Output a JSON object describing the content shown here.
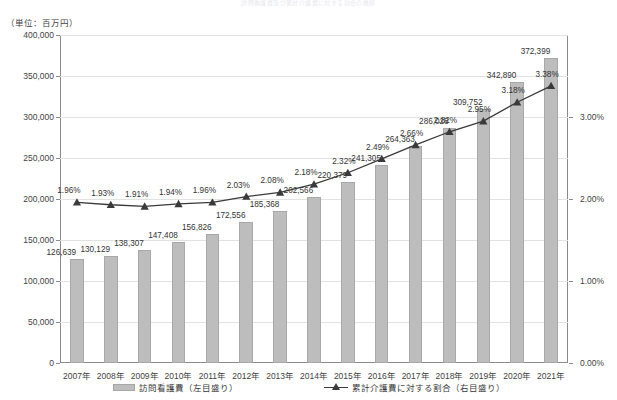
{
  "title_cropped": "訪問看護費及び累計介護費に対する割合の推移",
  "unit_note": "（単位：百万円）",
  "legend": {
    "bar_label": "訪問看護費（左目盛り）",
    "line_label": "累計介護費に対する割合（右目盛り）"
  },
  "axes": {
    "left_ticks": [
      "0",
      "50,000",
      "100,000",
      "150,000",
      "200,000",
      "250,000",
      "300,000",
      "350,000",
      "400,000"
    ],
    "right_ticks": [
      "0.00%",
      "1.00%",
      "2.00%",
      "3.00%"
    ]
  },
  "chart_data": {
    "type": "bar",
    "title": "訪問看護費及び累計介護費に対する割合の推移",
    "subtitle": "（単位：百万円）",
    "xlabel": "",
    "ylabel": "訪問看護費（百万円）",
    "y2label": "累計介護費に対する割合",
    "ylim": [
      0,
      400000
    ],
    "y2lim": [
      0,
      4.0
    ],
    "ytick_values": [
      0,
      50000,
      100000,
      150000,
      200000,
      250000,
      300000,
      350000,
      400000
    ],
    "y2tick_values": [
      0.0,
      1.0,
      2.0,
      3.0
    ],
    "grid": true,
    "legend_position": "bottom",
    "categories": [
      "2007年",
      "2008年",
      "2009年",
      "2010年",
      "2011年",
      "2012年",
      "2013年",
      "2014年",
      "2015年",
      "2016年",
      "2017年",
      "2018年",
      "2019年",
      "2020年",
      "2021年"
    ],
    "series": [
      {
        "name": "訪問看護費（左目盛り）",
        "type": "bar",
        "axis": "left",
        "color": "#bdbdbd",
        "values": [
          126639,
          130129,
          138307,
          147408,
          156826,
          172556,
          185368,
          202566,
          220379,
          241305,
          264363,
          286028,
          309752,
          342890,
          372399
        ],
        "labels": [
          "126,639",
          "130,129",
          "138,307",
          "147,408",
          "156,826",
          "172,556",
          "185,368",
          "202,566",
          "220,379",
          "241,305",
          "264,363",
          "286,028",
          "309,752",
          "342,890",
          "372,399"
        ]
      },
      {
        "name": "累計介護費に対する割合（右目盛り）",
        "type": "line",
        "axis": "right",
        "color": "#3a3a3a",
        "marker": "triangle",
        "values": [
          1.96,
          1.93,
          1.91,
          1.94,
          1.96,
          2.03,
          2.08,
          2.18,
          2.32,
          2.49,
          2.66,
          2.82,
          2.95,
          3.18,
          3.38
        ],
        "labels": [
          "1.96%",
          "1.93%",
          "1.91%",
          "1.94%",
          "1.96%",
          "2.03%",
          "2.08%",
          "2.18%",
          "2.32%",
          "2.49%",
          "2.66%",
          "2.82%",
          "2.95%",
          "3.18%",
          "3.38%"
        ]
      }
    ]
  }
}
